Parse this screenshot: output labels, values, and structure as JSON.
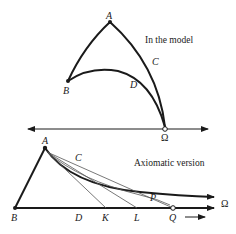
{
  "top_figure": {
    "caption": "In the model",
    "points": {
      "A": "A",
      "B": "B",
      "C": "C",
      "D": "D",
      "Omega": "Ω"
    }
  },
  "bottom_figure": {
    "caption": "Axiomatic version",
    "points": {
      "A": "A",
      "B": "B",
      "C": "C",
      "D": "D",
      "K": "K",
      "L": "L",
      "P": "P",
      "Q": "Q",
      "Omega": "Ω"
    }
  },
  "colors": {
    "stroke": "#1a1a1a",
    "thin_stroke": "#555555",
    "background": "#ffffff"
  }
}
